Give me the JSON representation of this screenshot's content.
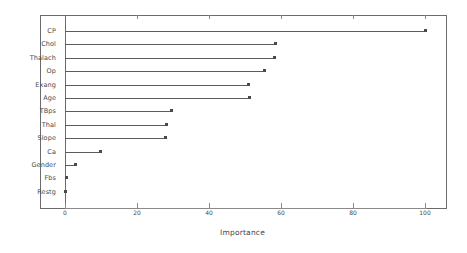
{
  "chart_data": {
    "type": "bar",
    "subtype": "horizontal-lollipop-dotchart",
    "title": "",
    "subtitle": "",
    "xlabel": "Importance",
    "ylabel": "",
    "categories": [
      "CP",
      "Chol",
      "Thalach",
      "Op",
      "Exang",
      "Age",
      "TBps",
      "Thal",
      "Slope",
      "Ca",
      "Gender",
      "Fbs",
      "Restg"
    ],
    "values": [
      100.0,
      58.6,
      58.3,
      55.3,
      51.1,
      51.3,
      29.7,
      28.3,
      27.8,
      9.8,
      3.0,
      0.4,
      0.0
    ],
    "series": [
      {
        "name": "Importance",
        "values": [
          100.0,
          58.6,
          58.3,
          55.3,
          51.1,
          51.3,
          29.7,
          28.3,
          27.8,
          9.8,
          3.0,
          0.4,
          0.0
        ]
      }
    ],
    "xlim": [
      0,
      107
    ],
    "ylim": [
      0,
      13
    ],
    "xticks": [
      0,
      20,
      40,
      60,
      80,
      100
    ],
    "xtick_labels": [
      "0",
      "20",
      "40",
      "60",
      "80",
      "100"
    ],
    "grid": false,
    "legend": false,
    "legend_position": "none",
    "annotations": [],
    "colors": {
      "line": "#5c5c5c",
      "dot": "#4a4a4a",
      "axis": "#6b6b6b",
      "text": "#4a4a4a",
      "background": "#ffffff"
    }
  }
}
